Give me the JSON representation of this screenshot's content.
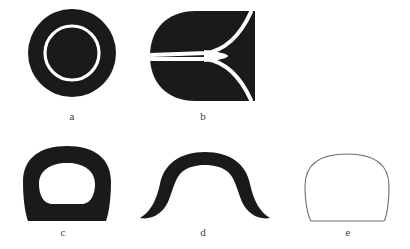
{
  "figure": {
    "background_color": "#ffffff",
    "ink_color": "#1a1a1a",
    "ink_color_soft": "#252525",
    "outline_color": "#6f6f6f",
    "highlight_color": "#ffffff",
    "panel_count": 5,
    "label_color": "#3b3b3b"
  },
  "panels": [
    {
      "id": "a",
      "label": "a",
      "shape_name": "filled-disc-with-white-ring",
      "description": "Solid dark circular blob containing a thin white circular ring, leaving a dark inner disc at the centre.",
      "fill": "#1a1a1a",
      "geometry": {
        "center_x": 48,
        "center_y": 49,
        "outer_radius": 44,
        "ring_radius": 27,
        "ring_stroke": 3
      }
    },
    {
      "id": "b",
      "label": "b",
      "shape_name": "d-shape-with-white-trident-slit",
      "description": "Dark D-shaped blob with a straight right edge and rounded left side, split by a white trident (Y) slit opening toward the right.",
      "fill": "#1a1a1a",
      "geometry": {
        "flat_edge_x": 107,
        "top_y": 5,
        "bottom_y": 95,
        "corner_radius": 45,
        "slit_stroke": 4
      }
    },
    {
      "id": "c",
      "label": "c",
      "shape_name": "rounded-square-annulus",
      "description": "Thick dark ring with a rounded-square outer boundary and a wider-than-tall rounded-rectangle hole.",
      "fill": "#1a1a1a",
      "geometry": {
        "outer_width": 92,
        "outer_height": 76,
        "wall_thickness": 17
      }
    },
    {
      "id": "d",
      "label": "d",
      "shape_name": "arch-with-flared-tips",
      "description": "Dark inverted-U arch whose two legs sweep outward and taper to sharp points, like a moustache.",
      "fill": "#1a1a1a",
      "geometry": {
        "span_width": 130,
        "arch_height": 68,
        "band_thickness": 18
      }
    },
    {
      "id": "e",
      "label": "e",
      "shape_name": "rounded-square-outline",
      "description": "Thin unfilled grey outline of a rounded square / squircle.",
      "fill": "none",
      "stroke": "#6f6f6f",
      "geometry": {
        "outer_width": 86,
        "outer_height": 70,
        "stroke_width": 1
      }
    }
  ]
}
